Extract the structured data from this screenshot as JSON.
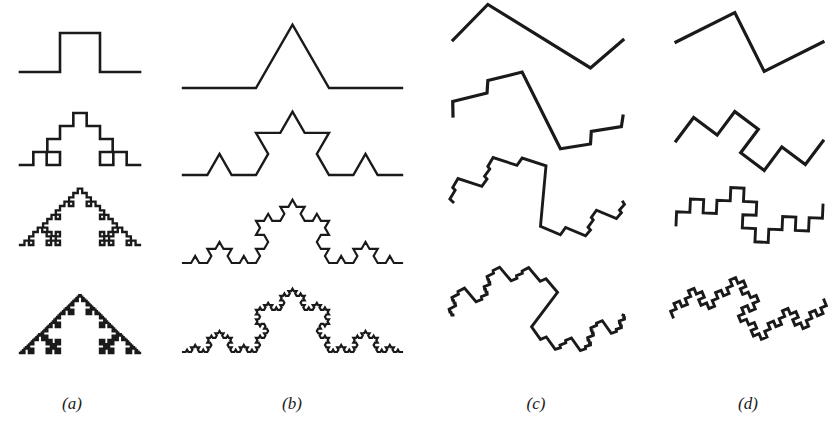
{
  "figure": {
    "stroke_color": "#1a1a1a",
    "background": "#ffffff",
    "columns": [
      {
        "id": "a",
        "label": "(a)",
        "label_x": 72,
        "kind": "square-bump curve (quadratic-type generator)",
        "generator": [
          [
            0,
            0
          ],
          [
            0.3333,
            0
          ],
          [
            0.3333,
            0.325
          ],
          [
            0.6667,
            0.325
          ],
          [
            0.6667,
            0
          ],
          [
            1,
            0
          ]
        ],
        "stroke_width": 2.6,
        "rows": [
          {
            "level": 1,
            "start": [
              20,
              72
            ],
            "end": [
              140,
              72
            ]
          },
          {
            "level": 2,
            "start": [
              20,
              165
            ],
            "end": [
              140,
              165
            ]
          },
          {
            "level": 3,
            "start": [
              20,
              245
            ],
            "end": [
              140,
              245
            ]
          },
          {
            "level": 4,
            "start": [
              20,
              353
            ],
            "end": [
              140,
              353
            ]
          }
        ]
      },
      {
        "id": "b",
        "label": "(b)",
        "label_x": 292,
        "kind": "Koch curve",
        "generator": [
          [
            0,
            0
          ],
          [
            0.3333,
            0
          ],
          [
            0.5,
            0.2887
          ],
          [
            0.6667,
            0
          ],
          [
            1,
            0
          ]
        ],
        "stroke_width": 2.4,
        "rows": [
          {
            "level": 1,
            "start": [
              183,
              88
            ],
            "end": [
              402,
              88
            ]
          },
          {
            "level": 2,
            "start": [
              183,
              175
            ],
            "end": [
              402,
              175
            ]
          },
          {
            "level": 3,
            "start": [
              183,
              263
            ],
            "end": [
              402,
              263
            ]
          },
          {
            "level": 4,
            "start": [
              183,
              352
            ],
            "end": [
              402,
              352
            ]
          }
        ]
      },
      {
        "id": "c",
        "label": "(c)",
        "label_x": 536,
        "kind": "three-segment zigzag generator",
        "generator": [
          [
            0,
            0
          ],
          [
            0.2049,
            0.2089
          ],
          [
            0.8088,
            -0.1646
          ],
          [
            1,
            0
          ]
        ],
        "stroke_width": 3.2,
        "rows": [
          {
            "level": 1,
            "start": [
              453,
              40
            ],
            "end": [
              623,
              40
            ]
          },
          {
            "level": 2,
            "start": [
              453,
              116
            ],
            "end": [
              623,
              116
            ]
          },
          {
            "level": 3,
            "start": [
              453,
              202
            ],
            "end": [
              623,
              202
            ]
          },
          {
            "level": 4,
            "start": [
              453,
              315
            ],
            "end": [
              623,
              315
            ]
          }
        ]
      },
      {
        "id": "d",
        "label": "(d)",
        "label_x": 748,
        "kind": "three-segment Z generator",
        "generator": [
          [
            0,
            0
          ],
          [
            0.4,
            0.2
          ],
          [
            0.6,
            -0.2
          ],
          [
            1,
            0
          ]
        ],
        "stroke_width": 3.2,
        "rows": [
          {
            "level": 1,
            "start": [
              676,
              42
            ],
            "end": [
              823,
              42
            ]
          },
          {
            "level": 2,
            "start": [
              676,
              141
            ],
            "end": [
              823,
              141
            ]
          },
          {
            "level": 3,
            "start": [
              676,
              225
            ],
            "end": [
              823,
              205
            ]
          },
          {
            "level": 4,
            "start": [
              673,
              317
            ],
            "end": [
              824,
              300
            ]
          }
        ]
      }
    ]
  }
}
